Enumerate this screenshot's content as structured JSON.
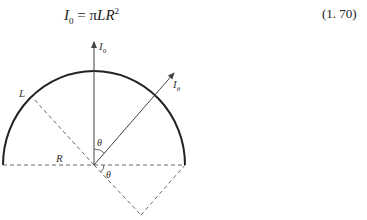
{
  "equation": {
    "lhs": "I",
    "lhs_sub": "0",
    "rhs_pi": "π",
    "rhs_vars": "LR",
    "rhs_sup": "2",
    "number": "(1. 70)"
  },
  "diagram": {
    "labels": {
      "vertical_arrow": "I",
      "vertical_arrow_sub": "0",
      "angled_arrow": "I",
      "angled_arrow_sub": "θ",
      "arc_point": "L",
      "radius": "R",
      "angle_upper": "θ",
      "angle_lower": "θ"
    },
    "colors": {
      "arc": "#222222",
      "lines": "#555555"
    }
  }
}
